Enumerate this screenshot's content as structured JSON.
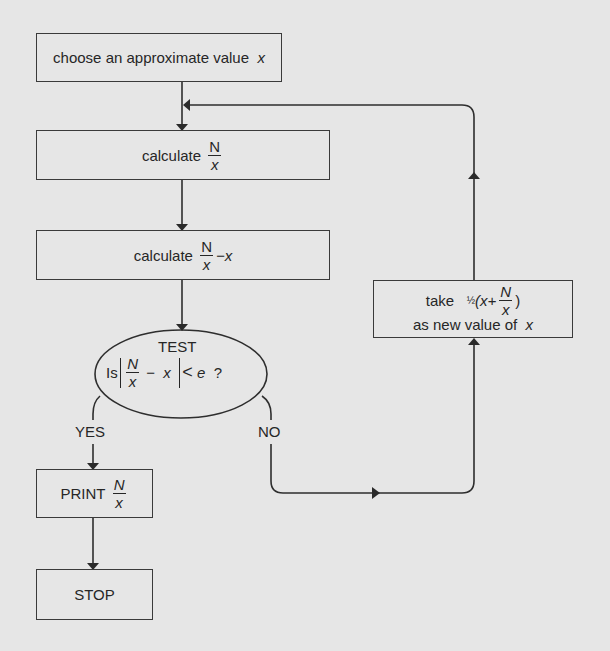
{
  "diagram": {
    "type": "flowchart",
    "colors": {
      "background": "#e6e6e6",
      "stroke": "#3a3a3a",
      "text": "#262626"
    },
    "nodes": {
      "start": {
        "text": "choose an approximate value",
        "var": "x"
      },
      "calc1": {
        "text": "calculate",
        "num": "N",
        "den": "x"
      },
      "calc2": {
        "text": "calculate",
        "num": "N",
        "den": "x",
        "suffix": "−x"
      },
      "test": {
        "title": "TEST",
        "prefix": "Is",
        "num": "N",
        "den": "x",
        "minus": "−",
        "var": "x",
        "lt": "<",
        "e": "e",
        "q": "?"
      },
      "print": {
        "text": "PRINT",
        "num": "N",
        "den": "x"
      },
      "stop": {
        "text": "STOP"
      },
      "update": {
        "take": "take",
        "half": "½",
        "open": "(x+",
        "num": "N",
        "den": "x",
        "close": ")",
        "line2": "as new value of",
        "var": "x"
      }
    },
    "edges": {
      "yes_label": "YES",
      "no_label": "NO"
    }
  }
}
